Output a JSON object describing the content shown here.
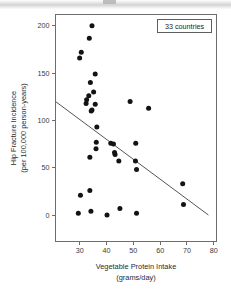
{
  "chart_data": {
    "type": "scatter",
    "title": "",
    "xlabel": "Vegetable Protein Intake",
    "xlabel_line2": "(grams/day)",
    "ylabel": "Hip Fracture Incidence",
    "ylabel_line2": "(per 100,000 person-years)",
    "xlim": [
      21,
      81
    ],
    "ylim": [
      -28,
      212
    ],
    "xticks": [
      30,
      40,
      50,
      60,
      70,
      80
    ],
    "yticks": [
      0,
      50,
      100,
      150,
      200
    ],
    "grid": false,
    "legend_position": "top-right",
    "annotation": "33 countries",
    "marker_color": "#131313",
    "line_color": "#555555",
    "axis_color": "#6d6d6d",
    "points": [
      {
        "x": 34.6,
        "y": 200
      },
      {
        "x": 33.6,
        "y": 187
      },
      {
        "x": 30.6,
        "y": 172
      },
      {
        "x": 30.0,
        "y": 166
      },
      {
        "x": 35.8,
        "y": 149
      },
      {
        "x": 34.0,
        "y": 140
      },
      {
        "x": 35.2,
        "y": 130
      },
      {
        "x": 33.4,
        "y": 126
      },
      {
        "x": 32.6,
        "y": 122
      },
      {
        "x": 32.4,
        "y": 118
      },
      {
        "x": 35.8,
        "y": 117
      },
      {
        "x": 34.6,
        "y": 111
      },
      {
        "x": 34.3,
        "y": 110
      },
      {
        "x": 48.8,
        "y": 120
      },
      {
        "x": 55.7,
        "y": 113
      },
      {
        "x": 36.4,
        "y": 93
      },
      {
        "x": 36.2,
        "y": 77
      },
      {
        "x": 41.6,
        "y": 76
      },
      {
        "x": 42.6,
        "y": 75
      },
      {
        "x": 50.9,
        "y": 76
      },
      {
        "x": 36.1,
        "y": 70
      },
      {
        "x": 43.0,
        "y": 66
      },
      {
        "x": 43.2,
        "y": 64
      },
      {
        "x": 33.8,
        "y": 61
      },
      {
        "x": 44.6,
        "y": 57
      },
      {
        "x": 50.8,
        "y": 57
      },
      {
        "x": 51.2,
        "y": 48
      },
      {
        "x": 68.4,
        "y": 33
      },
      {
        "x": 33.8,
        "y": 26
      },
      {
        "x": 30.3,
        "y": 21
      },
      {
        "x": 68.7,
        "y": 11
      },
      {
        "x": 45.0,
        "y": 7
      },
      {
        "x": 34.2,
        "y": 4
      },
      {
        "x": 29.5,
        "y": 2
      },
      {
        "x": 51.2,
        "y": 2
      },
      {
        "x": 40.2,
        "y": 0
      }
    ],
    "fit_line": {
      "x1": 21,
      "y1": 120,
      "x2": 78,
      "y2": 0
    }
  }
}
